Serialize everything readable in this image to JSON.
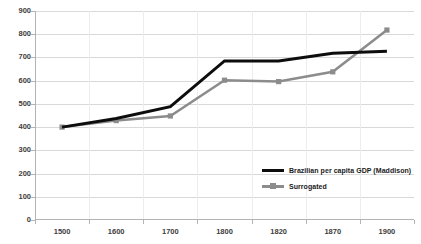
{
  "chart_data": {
    "type": "line",
    "title": "",
    "subtitle": "",
    "xlabel": "",
    "ylabel": "",
    "categories": [
      "1500",
      "1600",
      "1700",
      "1800",
      "1820",
      "1870",
      "1900"
    ],
    "x_tick_labels": [
      "1500",
      "1600",
      "1700",
      "1800",
      "1820",
      "1870",
      "1900"
    ],
    "y_tick_labels": [
      "0",
      "100",
      "200",
      "300",
      "400",
      "500",
      "600",
      "700",
      "800",
      "900"
    ],
    "ylim": [
      0,
      900
    ],
    "y_tick_step": 100,
    "grid": "horizontal",
    "legend_position": "inside-right",
    "series": [
      {
        "name": "Brazilian per capita GDP (Maddison)",
        "color": "#0d0d0d",
        "marker": "none",
        "line_width": 3,
        "values": [
          400,
          437,
          488,
          685,
          685,
          718,
          727
        ]
      },
      {
        "name": "Surrogated",
        "color": "#8c8c8c",
        "marker": "square",
        "line_width": 2.5,
        "values": [
          400,
          428,
          448,
          602,
          596,
          638,
          818
        ]
      }
    ],
    "legend_entries": [
      {
        "label": "Brazilian per capita GDP (Maddison)",
        "color": "#0d0d0d",
        "marker": "none"
      },
      {
        "label": "Surrogated",
        "color": "#8c8c8c",
        "marker": "square"
      }
    ],
    "colors": {
      "background": "#ffffff",
      "gridline": "#d9d9d9",
      "axis": "#b3b3b3",
      "tick_text": "#3d3d3d",
      "legend_text": "#1a1a1a"
    }
  }
}
